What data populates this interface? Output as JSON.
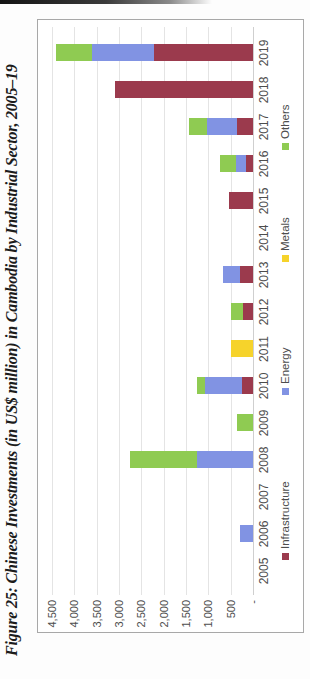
{
  "figure": {
    "title": "Figure 25: Chinese Investments (in US$ million) in Cambodia by Industrial Sector, 2005–19",
    "rotation": "figure rendered rotated 90° counter-clockwise on portrait page"
  },
  "chart_data": {
    "type": "bar",
    "stacked": true,
    "title": "",
    "xlabel": "",
    "ylabel": "",
    "categories": [
      "2005",
      "2006",
      "2007",
      "2008",
      "2009",
      "2010",
      "2011",
      "2012",
      "2013",
      "2014",
      "2015",
      "2016",
      "2017",
      "2018",
      "2019"
    ],
    "series": [
      {
        "name": "Infrastructure",
        "color": "#9b3a4d",
        "values": [
          0,
          0,
          0,
          0,
          0,
          250,
          0,
          220,
          300,
          0,
          540,
          150,
          360,
          3100,
          2220
        ]
      },
      {
        "name": "Energy",
        "color": "#8193e3",
        "values": [
          0,
          300,
          0,
          1250,
          0,
          830,
          0,
          0,
          380,
          0,
          0,
          225,
          670,
          0,
          1390
        ]
      },
      {
        "name": "Metals",
        "color": "#f6d32b",
        "values": [
          0,
          0,
          0,
          0,
          0,
          0,
          490,
          0,
          0,
          0,
          0,
          0,
          0,
          0,
          0
        ]
      },
      {
        "name": "Others",
        "color": "#8fcb52",
        "values": [
          0,
          0,
          0,
          1500,
          360,
          180,
          0,
          270,
          0,
          0,
          0,
          360,
          400,
          0,
          810
        ]
      }
    ],
    "ylim": [
      0,
      4500
    ],
    "ytick_interval": 500,
    "ytick_labels": [
      "-",
      "500",
      "1,000",
      "1,500",
      "2,000",
      "2,500",
      "3,000",
      "3,500",
      "4,000",
      "4,500"
    ],
    "grid": true,
    "legend_position": "bottom",
    "legend_order": [
      "Infrastructure",
      "Energy",
      "Metals",
      "Others"
    ]
  },
  "colors": {
    "chart_border": "#a8a8a8",
    "gridline": "#e4e4e4",
    "axis_text": "#4d4d4d",
    "page_background": "#fdfdfd"
  }
}
